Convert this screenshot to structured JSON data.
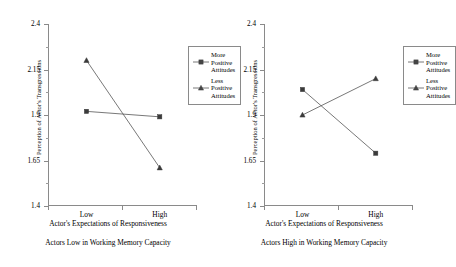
{
  "figure": {
    "panels": [
      {
        "id": "low-wmc",
        "caption": "Actors Low in Working Memory Capacity",
        "ylabel": "Perception of Actor's Transgressions",
        "xlabel": "Actor's Expectations of Responsiveness"
      },
      {
        "id": "high-wmc",
        "caption": "Actors High in Working Memory Capacity",
        "ylabel": "Perception of Actor's Transgressions",
        "xlabel": "Actor's Expectations of Responsiveness"
      }
    ],
    "legend": {
      "entries": [
        {
          "label": "More\nPositive\nAttitudes",
          "marker": "square-marker",
          "color": "#444444"
        },
        {
          "label": "Less\nPositive\nAttitudes",
          "marker": "triangle-marker",
          "color": "#444444"
        }
      ]
    },
    "colors": {
      "line": "#555555",
      "marker": "#3b3b3b",
      "axis": "#8a8a8a",
      "text": "#000000"
    }
  },
  "chart_data": [
    {
      "type": "line",
      "title": "Actors Low in Working Memory Capacity",
      "xlabel": "Actor's Expectations of Responsiveness",
      "ylabel": "Perception of Actor's Transgressions",
      "categories": [
        "Low",
        "High"
      ],
      "ylim": [
        1.4,
        2.4
      ],
      "yticks": [
        1.4,
        1.65,
        1.9,
        2.15,
        2.4
      ],
      "ytick_labels": [
        "1.4",
        "1.65",
        "1.9",
        "2.15",
        "2.4"
      ],
      "minor_yticks": [
        1.525,
        1.775,
        2.025,
        2.275
      ],
      "grid": false,
      "legend_position": "upper-right",
      "series": [
        {
          "name": "More Positive Attitudes",
          "marker": "square",
          "values": [
            1.92,
            1.89
          ]
        },
        {
          "name": "Less Positive Attitudes",
          "marker": "triangle",
          "values": [
            2.2,
            1.61
          ]
        }
      ]
    },
    {
      "type": "line",
      "title": "Actors High in Working Memory Capacity",
      "xlabel": "Actor's Expectations of Responsiveness",
      "ylabel": "Perception of Actor's Transgressions",
      "categories": [
        "Low",
        "High"
      ],
      "ylim": [
        1.4,
        2.4
      ],
      "yticks": [
        1.4,
        1.65,
        1.9,
        2.15,
        2.4
      ],
      "ytick_labels": [
        "1.4",
        "1.65",
        "1.9",
        "2.15",
        "2.4"
      ],
      "minor_yticks": [
        1.525,
        1.775,
        2.025,
        2.275
      ],
      "grid": false,
      "legend_position": "upper-right",
      "series": [
        {
          "name": "More Positive Attitudes",
          "marker": "square",
          "values": [
            2.04,
            1.69
          ]
        },
        {
          "name": "Less Positive Attitudes",
          "marker": "triangle",
          "values": [
            1.9,
            2.1
          ]
        }
      ]
    }
  ]
}
